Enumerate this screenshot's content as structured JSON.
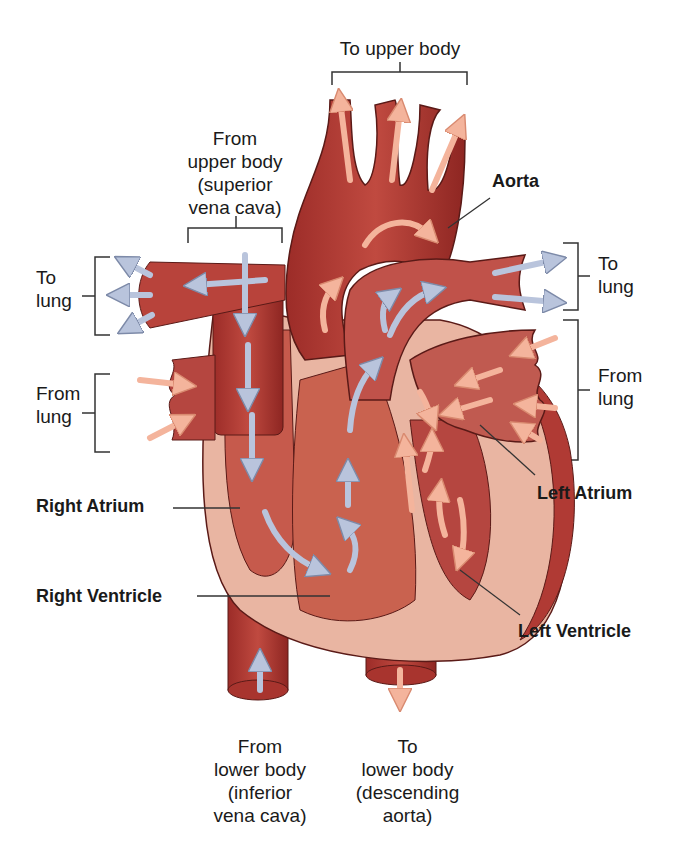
{
  "diagram": {
    "colors": {
      "muscle": "#b03a34",
      "muscle_dark": "#8e2622",
      "lining": "#e9b5a2",
      "chamber": "#c65a4c",
      "oxygenated_arrow": "#f4b49c",
      "deoxygenated_arrow": "#b9c4dc",
      "label_text": "#1a1a1a",
      "leader_line": "#333333"
    },
    "labels": {
      "to_upper_body": "To upper body",
      "from_upper_body": [
        "From",
        "upper body",
        "(superior",
        "vena cava)"
      ],
      "aorta": "Aorta",
      "to_lung_left": [
        "To",
        "lung"
      ],
      "to_lung_right": [
        "To",
        "lung"
      ],
      "from_lung_left": [
        "From",
        "lung"
      ],
      "from_lung_right": [
        "From",
        "lung"
      ],
      "left_atrium": "Left Atrium",
      "right_atrium": "Right Atrium",
      "right_ventricle": "Right Ventricle",
      "left_ventricle": "Left Ventricle",
      "from_lower_body": [
        "From",
        "lower body",
        "(inferior",
        "vena cava)"
      ],
      "to_lower_body": [
        "To",
        "lower body",
        "(descending",
        "aorta)"
      ]
    },
    "legend_semantics": {
      "blue_arrows": "deoxygenated blood flow",
      "pink_arrows": "oxygenated blood flow"
    }
  }
}
